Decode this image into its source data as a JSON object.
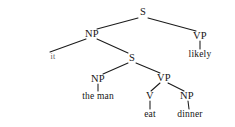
{
  "figure": {
    "kind": "syntactic-parse-tree",
    "background_color": "#ffffff",
    "ink_color": "#1b1b1b",
    "sentence": "it the man eat dinner likely"
  },
  "nodes": {
    "s_root": {
      "label": "S",
      "x": 143,
      "y": 12
    },
    "np_subject": {
      "label": "NP",
      "x": 92,
      "y": 34
    },
    "vp_matrix": {
      "label": "VP",
      "x": 200,
      "y": 36
    },
    "leaf_it": {
      "label": "it",
      "x": 53,
      "y": 57
    },
    "leaf_likely": {
      "label": "likely",
      "x": 200,
      "y": 55
    },
    "s_embedded": {
      "label": "S",
      "x": 132,
      "y": 58
    },
    "np_embedded_subject": {
      "label": "NP",
      "x": 98,
      "y": 79
    },
    "vp_embedded": {
      "label": "VP",
      "x": 164,
      "y": 78
    },
    "leaf_the_man": {
      "label": "the man",
      "x": 98,
      "y": 97
    },
    "v_verb": {
      "label": "V",
      "x": 150,
      "y": 96
    },
    "np_object": {
      "label": "NP",
      "x": 187,
      "y": 96
    },
    "leaf_eat": {
      "label": "eat",
      "x": 150,
      "y": 115
    },
    "leaf_dinner": {
      "label": "dinner",
      "x": 190,
      "y": 115
    }
  },
  "edges": [
    {
      "name": "edge-s-root-to-np-subject",
      "x1": 138,
      "y1": 18,
      "x2": 97,
      "y2": 29
    },
    {
      "name": "edge-s-root-to-vp-matrix",
      "x1": 148,
      "y1": 18,
      "x2": 196,
      "y2": 31
    },
    {
      "name": "edge-np-subject-to-it",
      "x1": 86,
      "y1": 39,
      "x2": 50,
      "y2": 52
    },
    {
      "name": "edge-np-subject-to-s-embedded",
      "x1": 97,
      "y1": 39,
      "x2": 128,
      "y2": 53
    },
    {
      "name": "edge-vp-matrix-to-likely",
      "x1": 200,
      "y1": 41,
      "x2": 200,
      "y2": 49
    },
    {
      "name": "edge-s-embedded-to-np-embedded",
      "x1": 128,
      "y1": 63,
      "x2": 103,
      "y2": 74
    },
    {
      "name": "edge-s-embedded-to-vp-embedded",
      "x1": 136,
      "y1": 63,
      "x2": 160,
      "y2": 73
    },
    {
      "name": "edge-np-embedded-to-the-man",
      "x1": 98,
      "y1": 84,
      "x2": 98,
      "y2": 91
    },
    {
      "name": "edge-vp-embedded-to-v",
      "x1": 160,
      "y1": 83,
      "x2": 151,
      "y2": 91
    },
    {
      "name": "edge-vp-embedded-to-np-object",
      "x1": 168,
      "y1": 83,
      "x2": 184,
      "y2": 91
    },
    {
      "name": "edge-v-to-eat",
      "x1": 150,
      "y1": 101,
      "x2": 150,
      "y2": 109
    },
    {
      "name": "edge-np-object-to-dinner",
      "x1": 188,
      "y1": 101,
      "x2": 189,
      "y2": 109
    }
  ]
}
